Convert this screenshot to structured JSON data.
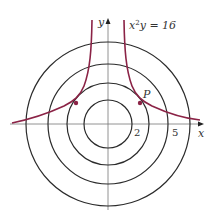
{
  "diagram": {
    "equation_label": "x²y = 16",
    "equation_parts": {
      "x": "x",
      "sup": "2",
      "rest": "y = 16"
    },
    "point_label": "P",
    "axis_labels": {
      "x": "x",
      "y": "y"
    },
    "tick_labels": [
      "2",
      "5"
    ],
    "circle_count": 4,
    "colors": {
      "curve": "#8b2346",
      "circle": "#2b2b2b",
      "axis": "#555555"
    }
  }
}
